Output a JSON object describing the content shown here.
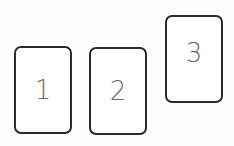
{
  "cards": [
    {
      "label": "1"
    },
    {
      "label": "2"
    },
    {
      "label": "3"
    }
  ]
}
